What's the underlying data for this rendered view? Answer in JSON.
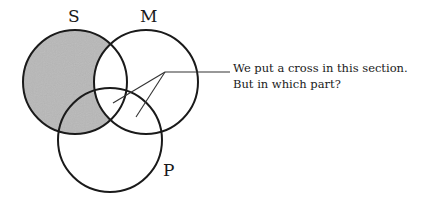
{
  "diagram": {
    "type": "venn-three-set",
    "sets": [
      {
        "id": "S",
        "label": "S",
        "cx": 75,
        "cy": 82,
        "r": 52
      },
      {
        "id": "M",
        "label": "M",
        "cx": 146,
        "cy": 82,
        "r": 52
      },
      {
        "id": "P",
        "label": "P",
        "cx": 110,
        "cy": 140,
        "r": 52
      }
    ],
    "shaded_region": "S minus M",
    "shade_color": "#b5b5b5",
    "stroke_color": "#1a1a1a",
    "annotation": {
      "line1": "We put a cross in this section.",
      "line2": "But in which part?"
    },
    "pointer": {
      "hub": [
        165,
        72
      ],
      "tail_end": [
        230,
        72
      ],
      "targets": [
        [
          113,
          103
        ],
        [
          136,
          117
        ]
      ]
    }
  }
}
